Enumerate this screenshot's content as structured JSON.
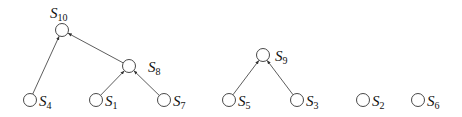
{
  "diagram": {
    "type": "forest",
    "nodes": [
      {
        "id": "S10",
        "base": "S",
        "sub": "10",
        "cx": 62,
        "cy": 30,
        "lx": 50,
        "ly": 18,
        "lanchor": "start"
      },
      {
        "id": "S4",
        "base": "S",
        "sub": "4",
        "cx": 30,
        "cy": 100,
        "lx": 39,
        "ly": 106
      },
      {
        "id": "S8",
        "base": "S",
        "sub": "8",
        "cx": 129,
        "cy": 66,
        "lx": 148,
        "ly": 72
      },
      {
        "id": "S1",
        "base": "S",
        "sub": "1",
        "cx": 96,
        "cy": 100,
        "lx": 105,
        "ly": 106
      },
      {
        "id": "S7",
        "base": "S",
        "sub": "7",
        "cx": 164,
        "cy": 100,
        "lx": 173,
        "ly": 106
      },
      {
        "id": "S9",
        "base": "S",
        "sub": "9",
        "cx": 263,
        "cy": 55,
        "lx": 275,
        "ly": 61
      },
      {
        "id": "S5",
        "base": "S",
        "sub": "5",
        "cx": 229,
        "cy": 100,
        "lx": 238,
        "ly": 106
      },
      {
        "id": "S3",
        "base": "S",
        "sub": "3",
        "cx": 297,
        "cy": 100,
        "lx": 306,
        "ly": 106
      },
      {
        "id": "S2",
        "base": "S",
        "sub": "2",
        "cx": 363,
        "cy": 100,
        "lx": 372,
        "ly": 106
      },
      {
        "id": "S6",
        "base": "S",
        "sub": "6",
        "cx": 418,
        "cy": 100,
        "lx": 427,
        "ly": 106
      }
    ],
    "edges": [
      {
        "from": "S4",
        "to": "S10"
      },
      {
        "from": "S8",
        "to": "S10"
      },
      {
        "from": "S1",
        "to": "S8"
      },
      {
        "from": "S7",
        "to": "S8"
      },
      {
        "from": "S5",
        "to": "S9"
      },
      {
        "from": "S3",
        "to": "S9"
      }
    ],
    "node_radius": 6.5,
    "colors": {
      "stroke": "#333333",
      "text": "#111111",
      "background": "#ffffff"
    }
  }
}
